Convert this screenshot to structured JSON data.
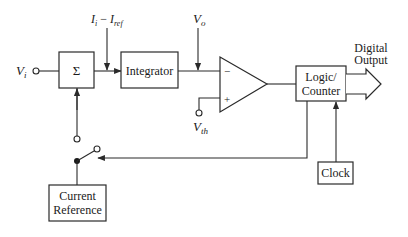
{
  "diagram": {
    "type": "block-diagram",
    "title": "",
    "blocks": {
      "summer": {
        "label": "Σ"
      },
      "integrator": {
        "label": "Integrator"
      },
      "logic_counter": {
        "line1": "Logic/",
        "line2": "Counter"
      },
      "current_reference": {
        "line1": "Current",
        "line2": "Reference"
      },
      "clock": {
        "label": "Clock"
      },
      "comparator": {
        "minus": "−",
        "plus": "+"
      }
    },
    "signals": {
      "input": {
        "main": "V",
        "sub": "i"
      },
      "current": {
        "a": "I",
        "a_sub": "i",
        "minus": " − ",
        "b": "I",
        "b_sub": "ref"
      },
      "integrator_out": {
        "main": "V",
        "sub": "o"
      },
      "threshold": {
        "main": "V",
        "sub": "th"
      }
    },
    "output": {
      "line1": "Digital",
      "line2": "Output"
    },
    "colors": {
      "line": "#2a2a2a",
      "background": "#ffffff"
    }
  }
}
